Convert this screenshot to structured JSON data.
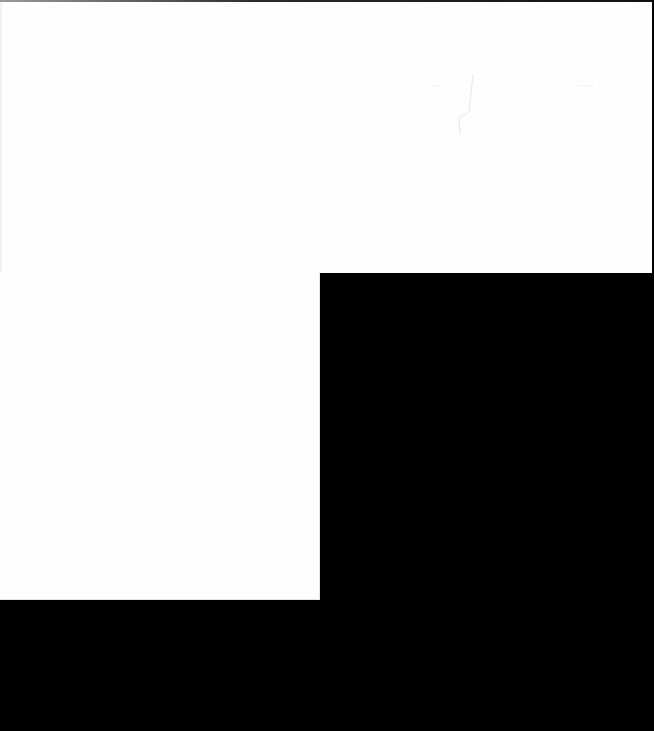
{
  "window": {
    "background_color": "#fefefe",
    "occluded_color": "#000000"
  },
  "canvas": {
    "faint_marks": [
      {
        "text": "~~~",
        "x": 432,
        "y": 82
      },
      {
        "text": "~~~~",
        "x": 577,
        "y": 82
      },
      {
        "text": "· ·",
        "x": 565,
        "y": 130
      }
    ]
  },
  "occluded_regions": [
    {
      "name": "lower-right-block",
      "x": 320,
      "y": 273,
      "width": 334,
      "height": 458
    },
    {
      "name": "bottom-strip",
      "x": 0,
      "y": 600,
      "width": 320,
      "height": 131
    }
  ]
}
